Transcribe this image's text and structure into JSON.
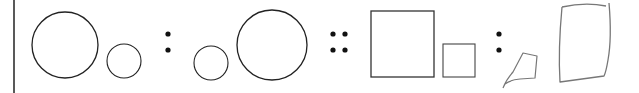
{
  "diagram": {
    "colors": {
      "stroke": "#222222",
      "sketch": "#777777",
      "dot": "#111111",
      "background": "#ffffff"
    },
    "separators": [
      {
        "type": "colon",
        "symbol": ":"
      },
      {
        "type": "double-colon",
        "symbol": "::"
      },
      {
        "type": "colon",
        "symbol": ":"
      }
    ],
    "shapes": [
      {
        "name": "large-circle",
        "cx": 65,
        "cy": 45,
        "r": 33
      },
      {
        "name": "small-circle",
        "cx": 124,
        "cy": 61,
        "r": 17
      },
      {
        "name": "small-circle-2",
        "cx": 211,
        "cy": 63,
        "r": 17
      },
      {
        "name": "large-circle-2",
        "cx": 272,
        "cy": 45,
        "r": 35
      },
      {
        "name": "large-square",
        "x": 371,
        "y": 11,
        "w": 63,
        "h": 66
      },
      {
        "name": "small-square",
        "x": 443,
        "y": 44,
        "w": 32,
        "h": 33
      },
      {
        "name": "sketched-small-quad"
      },
      {
        "name": "sketched-large-quad"
      }
    ]
  }
}
